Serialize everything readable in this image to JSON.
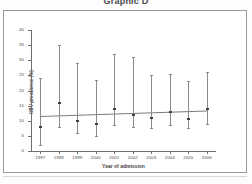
{
  "figure": {
    "title": "Graphic D"
  },
  "chart_data": {
    "type": "scatter",
    "title": "Graphic D",
    "xlabel": "Year of admission",
    "ylabel": "HBV prevalence (%)",
    "x": [
      "1997",
      "1998",
      "1999",
      "2000",
      "2001",
      "2002",
      "2003",
      "2004",
      "2005",
      "2006"
    ],
    "categories": [
      "1997",
      "1998",
      "1999",
      "2000",
      "2001",
      "2002",
      "2003",
      "2004",
      "2005",
      "2006"
    ],
    "values": [
      8.0,
      16.0,
      10.0,
      9.0,
      14.0,
      12.0,
      11.0,
      13.0,
      10.5,
      14.0
    ],
    "ci_lower": [
      2.0,
      8.0,
      6.0,
      5.0,
      8.5,
      8.0,
      7.5,
      8.5,
      7.5,
      9.0
    ],
    "ci_upper": [
      24.0,
      35.0,
      29.0,
      23.5,
      32.0,
      31.0,
      25.0,
      25.5,
      23.0,
      26.0
    ],
    "errorbars": true,
    "trendline": {
      "y_start": 11.6,
      "y_end": 13.4
    },
    "ylim": [
      0,
      40
    ],
    "yticks": [
      0,
      5,
      10,
      15,
      20,
      25,
      30,
      35,
      40
    ],
    "ytick_labels": [
      "0",
      "5",
      "10",
      "15",
      "20",
      "25",
      "30",
      "35",
      "40"
    ],
    "grid": false,
    "legend": null
  }
}
